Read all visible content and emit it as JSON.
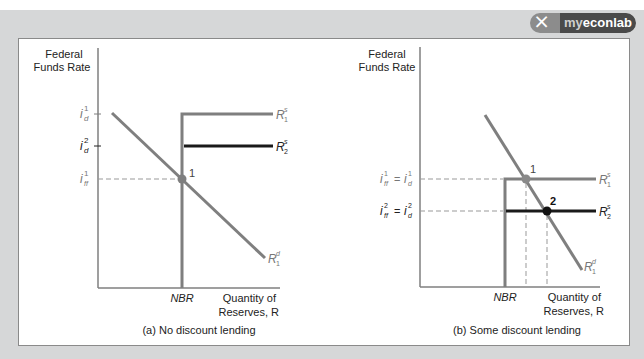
{
  "badge": {
    "icon": "myeconlab-logo-icon",
    "prefix": "my",
    "brand": "econlab"
  },
  "panels": [
    {
      "caption": "(a) No discount lending",
      "y_axis_label_line1": "Federal",
      "y_axis_label_line2": "Funds Rate",
      "x_axis_label_line1": "Quantity of",
      "x_axis_label_line2": "Reserves, R",
      "nbr_label": "NBR",
      "y_ticks": [
        "i_d^1",
        "i_d^2",
        "i_ff^1"
      ],
      "curves": [
        "R_1^s",
        "R_2^s",
        "R_1^d"
      ],
      "points": [
        "1"
      ]
    },
    {
      "caption": "(b) Some discount lending",
      "y_axis_label_line1": "Federal",
      "y_axis_label_line2": "Funds Rate",
      "x_axis_label_line1": "Quantity of",
      "x_axis_label_line2": "Reserves, R",
      "nbr_label": "NBR",
      "y_ticks": [
        "i_ff^1 = i_d^1",
        "i_ff^2 = i_d^2"
      ],
      "curves": [
        "R_1^s",
        "R_2^s",
        "R_1^d"
      ],
      "points": [
        "1",
        "2"
      ]
    }
  ],
  "colors": {
    "gray_line": "#7f7f7f",
    "black_line": "#1a1a1a",
    "frame": "#d6d7d8"
  }
}
